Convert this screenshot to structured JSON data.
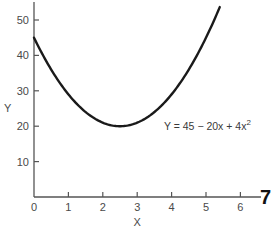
{
  "chart_data": {
    "type": "line",
    "title": "",
    "xlabel": "X",
    "ylabel": "Y",
    "xlim": [
      0,
      6.6
    ],
    "ylim": [
      0,
      56
    ],
    "x_ticks": [
      0,
      1,
      2,
      3,
      4,
      5,
      6
    ],
    "y_ticks": [
      10,
      20,
      30,
      40,
      50
    ],
    "grid": false,
    "legend": null,
    "annotations": [
      {
        "text": "Y = 45 − 20x + 4x²",
        "base": "Y = 45 − 20x + 4x",
        "sup": "2",
        "x": 4.6,
        "y": 20
      }
    ],
    "series": [
      {
        "name": "Y = 45 - 20x + 4x^2",
        "equation": {
          "a": 4,
          "b": -20,
          "c": 45
        },
        "x": [
          0,
          0.5,
          1,
          1.5,
          2,
          2.5,
          3,
          3.5,
          4,
          4.5,
          5,
          5.4
        ],
        "values": [
          45,
          36,
          29,
          24,
          21,
          20,
          21,
          24,
          29,
          36,
          45,
          53.6
        ]
      }
    ],
    "margin_fragment": "7"
  }
}
